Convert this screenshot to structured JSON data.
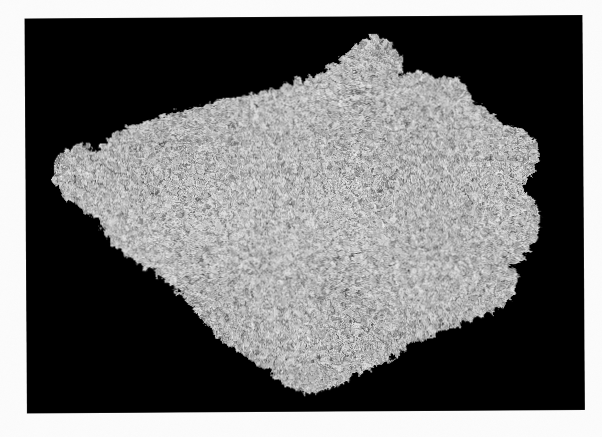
{
  "image": {
    "domain": "natural-image",
    "subject": "coarse-grained granular rock specimen",
    "description": "Monochrome photograph of an irregular slab-like rock specimen with a dense speckled crystalline texture, isolated on a black background",
    "orientation": "landscape",
    "color_mode": "grayscale",
    "page_background_color": "#fbfbfb",
    "photo_background_color": "#000000",
    "photo_frame": {
      "left": 25,
      "top": 19,
      "width": 557,
      "height": 394,
      "rotation_deg": -0.35
    },
    "specimen": {
      "name": "rock-specimen",
      "bounding_box": {
        "x": 48,
        "y": 36,
        "width": 494,
        "height": 360
      },
      "fill_base_color": "#8a8a8a",
      "highlight_color": "#f2f2f2",
      "shadow_color": "#050505",
      "mid_tone_color": "#6e6e6e",
      "texture": "speckled granular crystalline",
      "outline_points": [
        [
          243,
          94
        ],
        [
          300,
          80
        ],
        [
          330,
          66
        ],
        [
          352,
          47
        ],
        [
          372,
          36
        ],
        [
          392,
          47
        ],
        [
          401,
          63
        ],
        [
          398,
          76
        ],
        [
          414,
          70
        ],
        [
          432,
          78
        ],
        [
          449,
          76
        ],
        [
          463,
          86
        ],
        [
          470,
          101
        ],
        [
          486,
          110
        ],
        [
          498,
          123
        ],
        [
          516,
          128
        ],
        [
          531,
          139
        ],
        [
          537,
          156
        ],
        [
          529,
          173
        ],
        [
          519,
          187
        ],
        [
          528,
          199
        ],
        [
          536,
          215
        ],
        [
          533,
          239
        ],
        [
          523,
          256
        ],
        [
          511,
          266
        ],
        [
          515,
          281
        ],
        [
          508,
          297
        ],
        [
          494,
          310
        ],
        [
          470,
          321
        ],
        [
          441,
          331
        ],
        [
          414,
          342
        ],
        [
          392,
          356
        ],
        [
          370,
          368
        ],
        [
          346,
          378
        ],
        [
          321,
          389
        ],
        [
          299,
          393
        ],
        [
          280,
          386
        ],
        [
          268,
          372
        ],
        [
          250,
          361
        ],
        [
          231,
          350
        ],
        [
          214,
          337
        ],
        [
          199,
          320
        ],
        [
          186,
          302
        ],
        [
          171,
          288
        ],
        [
          155,
          276
        ],
        [
          140,
          266
        ],
        [
          126,
          257
        ],
        [
          113,
          248
        ],
        [
          104,
          236
        ],
        [
          96,
          222
        ],
        [
          86,
          212
        ],
        [
          72,
          202
        ],
        [
          58,
          190
        ],
        [
          49,
          174
        ],
        [
          52,
          159
        ],
        [
          63,
          148
        ],
        [
          78,
          142
        ],
        [
          92,
          150
        ],
        [
          101,
          142
        ],
        [
          112,
          131
        ],
        [
          128,
          124
        ],
        [
          146,
          119
        ],
        [
          163,
          113
        ],
        [
          182,
          108
        ],
        [
          203,
          103
        ],
        [
          223,
          98
        ]
      ]
    }
  }
}
